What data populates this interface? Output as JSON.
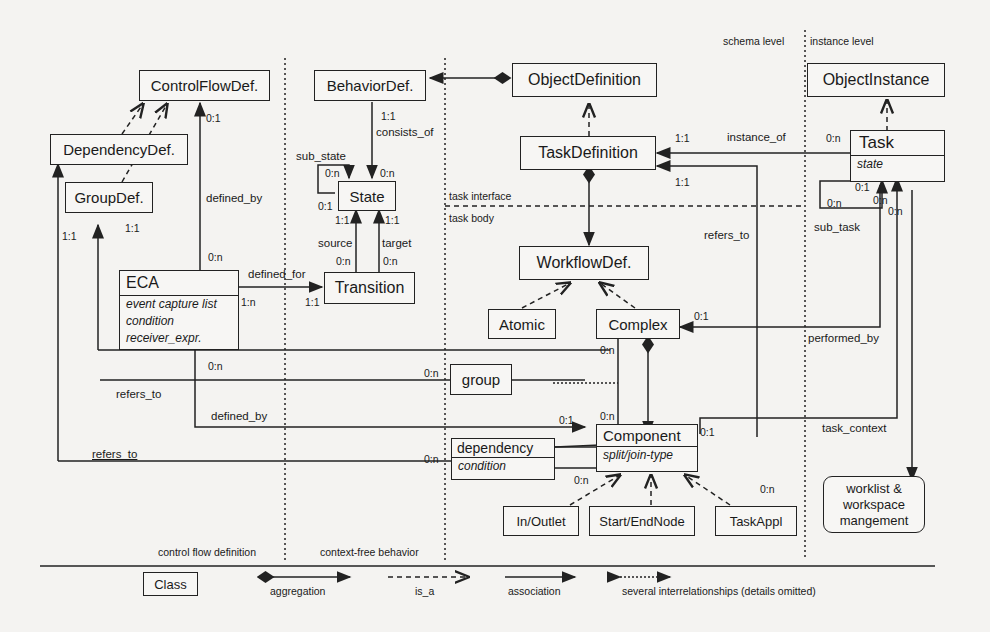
{
  "classes": {
    "control_flow_def": "ControlFlowDef.",
    "behavior_def": "BehaviorDef.",
    "object_definition": "ObjectDefinition",
    "object_instance": "ObjectInstance",
    "dependency_def": "DependencyDef.",
    "group_def": "GroupDef.",
    "state": "State",
    "task_definition": "TaskDefinition",
    "task": {
      "name": "Task",
      "attrs": [
        "state"
      ]
    },
    "eca": {
      "name": "ECA",
      "attrs": [
        "event capture list",
        "condition",
        "receiver_expr."
      ]
    },
    "transition": "Transition",
    "workflow_def": "WorkflowDef.",
    "atomic": "Atomic",
    "complex": "Complex",
    "group": "group",
    "component": {
      "name": "Component",
      "attrs": [
        "split/join-type"
      ]
    },
    "dependency": {
      "name": "dependency",
      "attrs": [
        "condition"
      ]
    },
    "in_outlet": "In/Outlet",
    "start_end_node": "Start/EndNode",
    "task_appl": "TaskAppl",
    "worklist": [
      "worklist &",
      "workspace",
      "mangement"
    ]
  },
  "relationships": {
    "defined_by_1": "defined_by",
    "consists_of": "consists_of",
    "sub_state": "sub_state",
    "source": "source",
    "target": "target",
    "defined_for": "defined_for",
    "instance_of": "instance_of",
    "refers_to_1": "refers_to",
    "refers_to_2": "refers_to",
    "refers_to_3": "refers_to",
    "defined_by_2": "defined_by",
    "sub_task": "sub_task",
    "performed_by": "performed_by",
    "task_context": "task_context"
  },
  "cardinalities": {
    "c01": "0:1",
    "c11a": "1:1",
    "c0na": "0:n",
    "c0nb": "0:n",
    "c01b": "0:1",
    "c11b": "1:1",
    "c11c": "1:1",
    "c0nc": "0:n",
    "c0nd": "0:n",
    "c11d": "1:1",
    "c1n": "1:n",
    "c11e": "1:1",
    "c11f": "1:1",
    "c0ne": "0:n",
    "c11g": "1:1",
    "c11h": "1:1",
    "c0nf": "0:n",
    "c01c": "0:1",
    "c0ng": "0:n",
    "c0nh": "0:n",
    "c0ni": "0:n",
    "c01d": "0:1",
    "c0nj": "0:n",
    "c0nk": "0:n",
    "c0nl": "0:n",
    "c01e": "0:1",
    "c0nm": "0:n",
    "c0nn": "0:n",
    "c0no": "0:n"
  },
  "regions": {
    "schema_level": "schema level",
    "instance_level": "instance level",
    "task_interface": "task interface",
    "task_body": "task body",
    "control_flow_definition": "control flow definition",
    "context_free_behavior": "context-free behavior"
  },
  "legend": {
    "class": "Class",
    "aggregation": "aggregation",
    "is_a": "is_a",
    "association": "association",
    "several": "several interrelationships (details omitted)"
  }
}
